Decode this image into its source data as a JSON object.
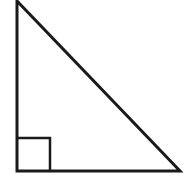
{
  "diagram": {
    "type": "right-triangle",
    "stroke_color": "#1a1a1a",
    "background": "#ffffff",
    "vertices": {
      "top": [
        17,
        1
      ],
      "right_angle": [
        17,
        171
      ],
      "bottom_right": [
        180,
        171
      ]
    },
    "right_angle_marker": {
      "x": 17,
      "y": 138,
      "size": 33
    }
  }
}
